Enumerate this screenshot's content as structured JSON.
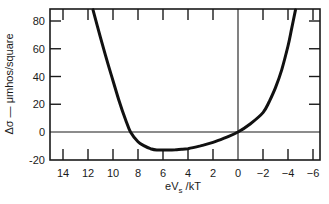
{
  "chart_data": {
    "type": "line",
    "title": "",
    "xlabel": "eV_s /kT",
    "xlabel_main": "eV",
    "xlabel_sub": "s",
    "xlabel_tail": " /kT",
    "ylabel": "Δσ — μmhos/square",
    "xlim": [
      15,
      -6.8
    ],
    "ylim": [
      -20,
      88
    ],
    "x_reversed": true,
    "grid": false,
    "legend": null,
    "x_ticks": [
      14,
      12,
      10,
      8,
      6,
      4,
      2,
      0,
      -2,
      -4,
      -6
    ],
    "x_tick_labels": [
      "14",
      "12",
      "10",
      "8",
      "6",
      "4",
      "2",
      "0",
      "−2",
      "−4",
      "−6"
    ],
    "y_ticks": [
      -20,
      0,
      20,
      40,
      60,
      80
    ],
    "y_tick_labels": [
      "-20",
      "0",
      "20",
      "40",
      "60",
      "80"
    ],
    "reference_lines": [
      {
        "orientation": "horizontal",
        "y": 0
      },
      {
        "orientation": "vertical",
        "x": 0
      }
    ],
    "series": [
      {
        "name": "Δσ",
        "x": [
          11.6,
          11.0,
          10.5,
          10.0,
          9.5,
          9.0,
          8.6,
          8.0,
          7.5,
          7.0,
          6.5,
          6.0,
          5.5,
          5.0,
          4.5,
          4.0,
          3.0,
          2.0,
          1.0,
          0.0,
          -1.0,
          -2.0,
          -2.5,
          -3.0,
          -3.5,
          -4.0,
          -4.3,
          -4.6
        ],
        "values": [
          88,
          68,
          52,
          37,
          22,
          9,
          0,
          -7,
          -10,
          -12,
          -13,
          -13,
          -13,
          -12.8,
          -12.5,
          -12,
          -10,
          -7.5,
          -4,
          0,
          6,
          14,
          22,
          32,
          45,
          62,
          75,
          88
        ]
      }
    ]
  }
}
